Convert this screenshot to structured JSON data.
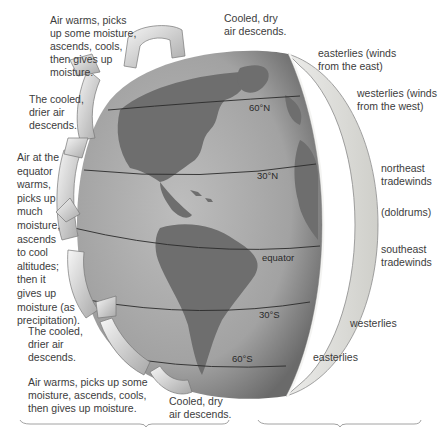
{
  "diagram": {
    "type": "global atmospheric circulation",
    "left_labels": [
      {
        "id": "polar-cell-rise-north",
        "text": "Air warms, picks\nup some moisture,\nascends, cools,\nthen gives up\nmoisture."
      },
      {
        "id": "descend-north",
        "text": "The cooled,\ndrier air\ndescends."
      },
      {
        "id": "equator-rise",
        "text": "Air at the\nequator\nwarms,\npicks up\nmuch\nmoisture,\nascends\nto cool\naltitudes;\nthen it\ngives up\nmoisture (as\nprecipitation)."
      },
      {
        "id": "descend-south",
        "text": "The cooled,\ndrier air\ndescends."
      },
      {
        "id": "rise-south",
        "text": "Air warms, picks up some\nmoisture, ascends, cools,\nthen gives up moisture."
      }
    ],
    "top_label": "Cooled, dry\nair descends.",
    "bottom_label": "Cooled, dry\nair descends.",
    "latitude_labels": [
      "60°N",
      "30°N",
      "equator",
      "30°S",
      "60°S"
    ],
    "right_labels": [
      {
        "id": "easterlies-north",
        "text": "easterlies (winds\nfrom the east)"
      },
      {
        "id": "westerlies-north",
        "text": "westerlies (winds\nfrom the west)"
      },
      {
        "id": "ne-tradewinds",
        "text": "northeast\ntradewinds"
      },
      {
        "id": "doldrums",
        "text": "(doldrums)"
      },
      {
        "id": "se-tradewinds",
        "text": "southeast\ntradewinds"
      },
      {
        "id": "westerlies-south",
        "text": "westerlies"
      },
      {
        "id": "easterlies-south",
        "text": "easterlies"
      }
    ],
    "colors": {
      "ocean": "#a9a9a9",
      "land": "#6e6e6e",
      "shell": "#d9d9d4",
      "arrow": "#e6e6e6",
      "text": "#3c3c3c"
    }
  }
}
